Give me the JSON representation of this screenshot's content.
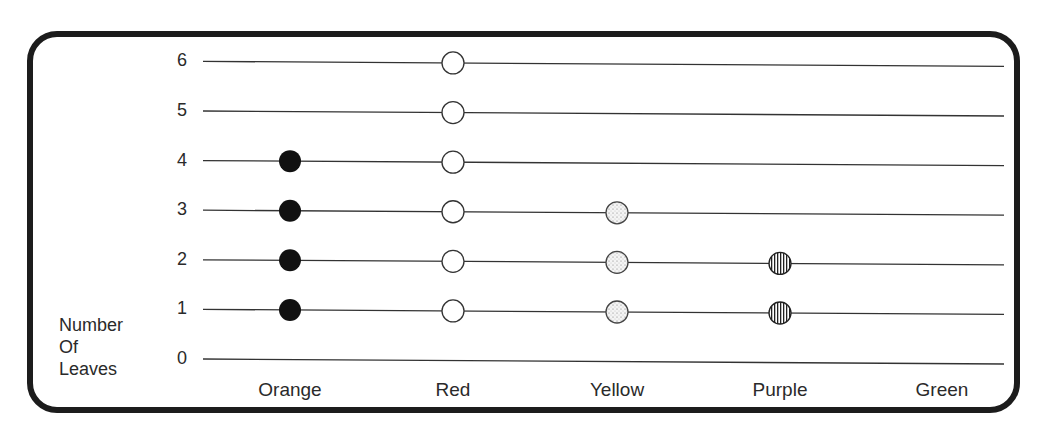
{
  "chart_data": {
    "type": "dot-plot",
    "title": "",
    "xlabel": "",
    "ylabel": "Number Of Leaves",
    "ylabel_lines": [
      "Number",
      "Of",
      "Leaves"
    ],
    "categories": [
      "Orange",
      "Red",
      "Yellow",
      "Purple",
      "Green"
    ],
    "values": [
      4,
      6,
      3,
      2,
      0
    ],
    "y_ticks": [
      "0",
      "1",
      "2",
      "3",
      "4",
      "5",
      "6"
    ],
    "ylim": [
      0,
      6
    ],
    "grid": true,
    "legend": "none",
    "markers": [
      {
        "category": "Orange",
        "style": "solid-black"
      },
      {
        "category": "Red",
        "style": "open-circle"
      },
      {
        "category": "Yellow",
        "style": "stippled"
      },
      {
        "category": "Purple",
        "style": "vertical-hatch"
      },
      {
        "category": "Green",
        "style": "none"
      }
    ]
  }
}
